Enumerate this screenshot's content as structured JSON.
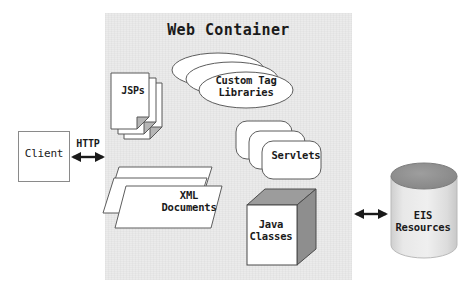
{
  "diagram": {
    "type": "architecture-diagram",
    "title": "Web Container",
    "canvas": {
      "width": 475,
      "height": 294,
      "background": "#ffffff"
    },
    "colors": {
      "container_fill": "#ebebeb",
      "shape_fill": "#ffffff",
      "shape_stroke": "#555555",
      "cube_shade": "#9a9a9a",
      "cylinder_top": "#8f8f8f",
      "cylinder_body": "#e2e2e2",
      "text": "#1a1a1a"
    },
    "container": {
      "label": "Web Container",
      "nodes": [
        {
          "id": "jsps",
          "label": "JSPs",
          "shape": "document-stack",
          "count": 3
        },
        {
          "id": "custom-tag-libraries",
          "label": "Custom Tag\nLibraries",
          "line1": "Custom Tag",
          "line2": "Libraries",
          "shape": "ellipse-stack",
          "count": 3
        },
        {
          "id": "servlets",
          "label": "Servlets",
          "shape": "rounded-rect-stack",
          "count": 3
        },
        {
          "id": "xml-documents",
          "label": "XML\nDocuments",
          "line1": "XML",
          "line2": "Documents",
          "shape": "parallelogram-stack",
          "count": 3
        },
        {
          "id": "java-classes",
          "label": "Java\nClasses",
          "line1": "Java",
          "line2": "Classes",
          "shape": "cube"
        }
      ]
    },
    "external": [
      {
        "id": "client",
        "label": "Client",
        "shape": "rectangle"
      },
      {
        "id": "eis-resources",
        "label": "EIS\nResources",
        "line1": "EIS",
        "line2": "Resources",
        "shape": "cylinder"
      }
    ],
    "connectors": [
      {
        "id": "client-http",
        "label": "HTTP",
        "from": "client",
        "to": "container",
        "style": "double-arrow"
      },
      {
        "id": "java-eis",
        "label": "",
        "from": "java-classes",
        "to": "eis-resources",
        "style": "double-arrow"
      }
    ]
  }
}
